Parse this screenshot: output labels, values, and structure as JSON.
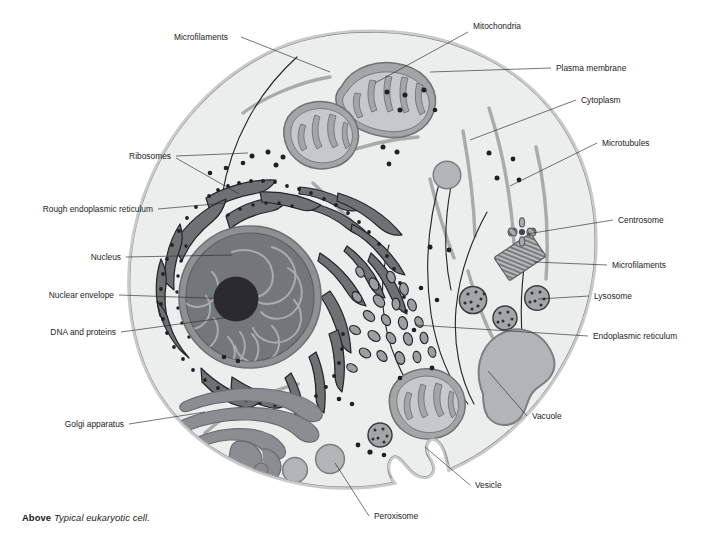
{
  "figure": {
    "title": "Typical eukaryotic cell",
    "caption_kicker": "Above",
    "caption_text": "Typical eukaryotic cell."
  },
  "labels": {
    "microfilaments_top": "Microfilaments",
    "mitochondria": "Mitochondria",
    "plasma_membrane": "Plasma membrane",
    "cytoplasm": "Cytoplasm",
    "microtubules": "Microtubules",
    "ribosomes": "Ribosomes",
    "rough_er": "Rough endoplasmic reticulum",
    "centrosome": "Centrosome",
    "microfilaments_right": "Microfilaments",
    "nucleus": "Nucleus",
    "lysosome": "Lysosome",
    "nuclear_envelope": "Nuclear envelope",
    "dna_and_proteins": "DNA and proteins",
    "endoplasmic_reticulum": "Endoplasmic reticulum",
    "golgi_apparatus": "Golgi apparatus",
    "vacuole": "Vacuole",
    "vesicle": "Vesicle",
    "peroxisome": "Peroxisome"
  },
  "colors": {
    "cytosol": "#eceded",
    "membrane_band": "#c9cbcb",
    "membrane_line": "#8e9192",
    "organelle_mid": "#9c9e9f",
    "organelle_light": "#bdbfc0",
    "er_dark": "#6e7172",
    "nucleoplasm": "#74777a",
    "nucleolus": "#2b2b2d",
    "nuclear_envelope": "#8b8e90",
    "leader": "#2b2b2b",
    "text": "#1c1c1c",
    "background": "#ffffff"
  }
}
